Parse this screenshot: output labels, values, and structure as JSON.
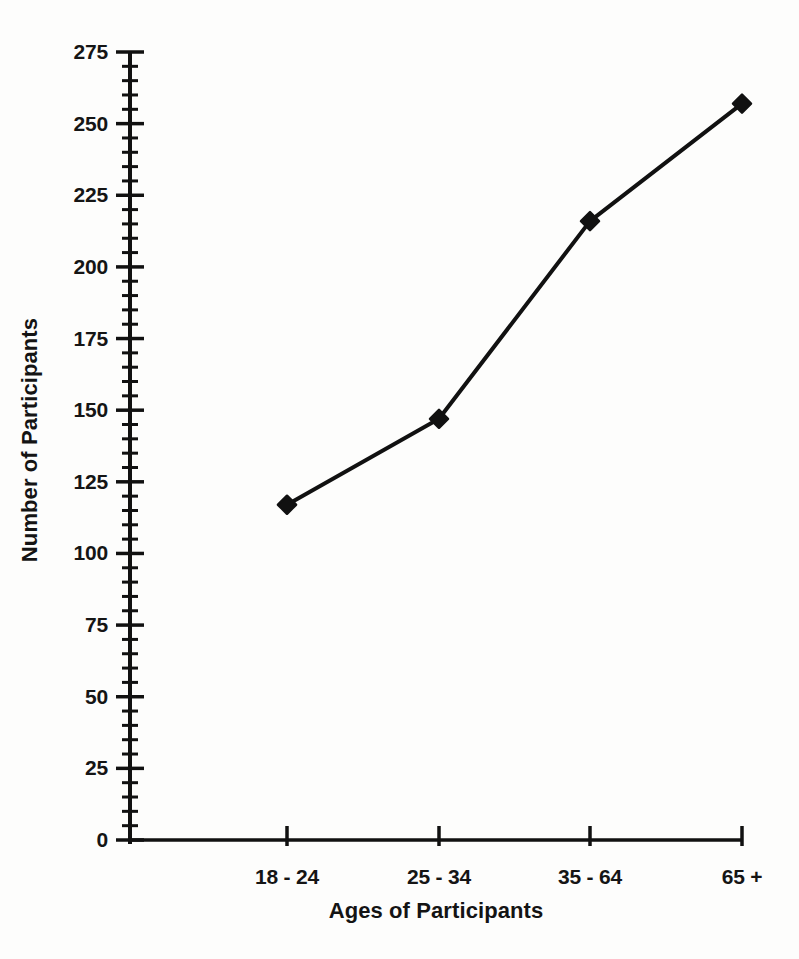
{
  "chart_data": {
    "type": "line",
    "title": "",
    "subtitle": "",
    "xlabel": "Ages of Participants",
    "ylabel": "Number of Participants",
    "categories": [
      "18 - 24",
      "25 - 34",
      "35 - 64",
      "65 +"
    ],
    "values": [
      117,
      147,
      216,
      257
    ],
    "series": [
      {
        "name": "Number of Participants",
        "values": [
          117,
          147,
          216,
          257
        ]
      }
    ],
    "ylim": [
      0,
      275
    ],
    "y_major_ticks": [
      0,
      25,
      50,
      75,
      100,
      125,
      150,
      175,
      200,
      225,
      250,
      275
    ],
    "y_tick_labels": [
      "0",
      "25",
      "50",
      "75",
      "100",
      "125",
      "150",
      "175",
      "200",
      "225",
      "250",
      "275"
    ],
    "y_minor_tick_step": 5,
    "x_tick_labels": [
      "18 - 24",
      "25 - 34",
      "35 - 64",
      "65 +"
    ],
    "grid": false,
    "legend": false,
    "legend_position": "none",
    "marker": "diamond",
    "line_color": "#111111",
    "marker_color": "#111111",
    "axis_color": "#111111",
    "background_color": "#fdfdfc",
    "annotations": []
  },
  "axis_titles": {
    "x": "Ages of Participants",
    "y": "Number of Participants"
  },
  "y_ticks": [
    {
      "label": "275",
      "value": 275
    },
    {
      "label": "250",
      "value": 250
    },
    {
      "label": "225",
      "value": 225
    },
    {
      "label": "200",
      "value": 200
    },
    {
      "label": "175",
      "value": 175
    },
    {
      "label": "150",
      "value": 150
    },
    {
      "label": "125",
      "value": 125
    },
    {
      "label": "100",
      "value": 100
    },
    {
      "label": "75",
      "value": 75
    },
    {
      "label": "50",
      "value": 50
    },
    {
      "label": "25",
      "value": 25
    },
    {
      "label": "0",
      "value": 0
    }
  ],
  "x_ticks": [
    {
      "label": "18 - 24",
      "value": 117
    },
    {
      "label": "25 - 34",
      "value": 147
    },
    {
      "label": "35 - 64",
      "value": 216
    },
    {
      "label": "65 +",
      "value": 257
    }
  ]
}
